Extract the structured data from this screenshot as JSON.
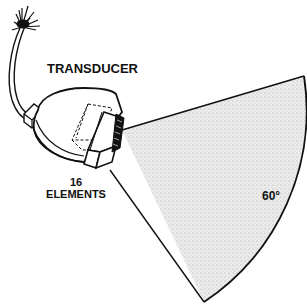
{
  "diagram": {
    "labels": {
      "transducer": "TRANSDUCER",
      "elements_count": "16",
      "elements_word": "ELEMENTS",
      "angle": "60°"
    },
    "colors": {
      "ink": "#111111",
      "beam_fill": "#e4e4e4",
      "background": "#ffffff"
    }
  }
}
